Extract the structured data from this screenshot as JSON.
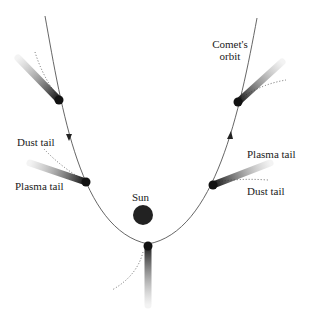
{
  "diagram": {
    "labels": {
      "orbit": [
        "Comet's",
        "orbit"
      ],
      "sun": "Sun",
      "left_dust_tail": "Dust tail",
      "left_plasma_tail": "Plasma tail",
      "right_plasma_tail": "Plasma tail",
      "right_dust_tail": "Dust tail"
    },
    "colors": {
      "orbit_line": "#555555",
      "comet_head": "#1a1a1a",
      "sun": "#222222",
      "dust": "#666666"
    }
  }
}
